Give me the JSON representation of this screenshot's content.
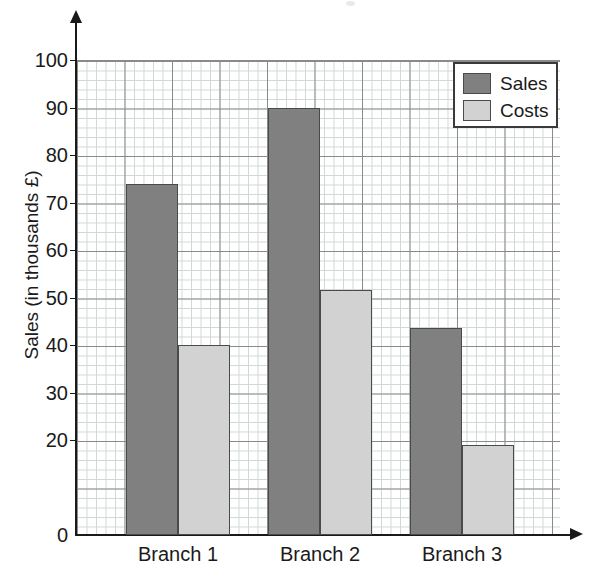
{
  "chart_data": {
    "type": "bar",
    "title": "",
    "subtitle": "",
    "xlabel": "",
    "ylabel": "Sales (in thousands £)",
    "categories": [
      "Branch 1",
      "Branch 2",
      "Branch 3"
    ],
    "series": [
      {
        "name": "Sales",
        "color": "#808080",
        "values": [
          74,
          90,
          43.5
        ]
      },
      {
        "name": "Costs",
        "color": "#d2d2d2",
        "values": [
          40,
          51.5,
          19
        ]
      }
    ],
    "ylim": [
      0,
      100
    ],
    "ytick_labels": [
      "100",
      "90",
      "80",
      "70",
      "60",
      "50",
      "40",
      "30",
      "20",
      "0"
    ],
    "ytick_values": [
      100,
      90,
      80,
      70,
      60,
      50,
      40,
      30,
      20,
      0
    ],
    "grid": "major and minor grid shown",
    "legend_position": "top-right",
    "annotations": []
  },
  "legend": {
    "items": [
      {
        "label": "Sales",
        "swatch": "dark-gray"
      },
      {
        "label": "Costs",
        "swatch": "light-gray"
      }
    ]
  },
  "axes": {
    "y_title": "Sales (in thousands £)",
    "x_arrow_icon": "arrow-right-icon",
    "y_arrow_icon": "arrow-up-icon"
  }
}
